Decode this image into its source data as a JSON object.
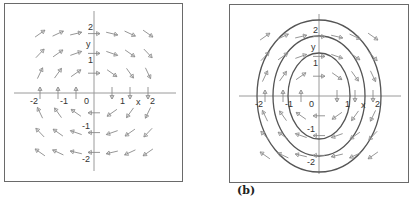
{
  "figure": {
    "caption_b": "(b)",
    "panels": [
      {
        "id": "a",
        "description": "Direction field of a rotational (clockwise) vector field",
        "x_tick_labels": [
          "-2",
          "-1",
          "0",
          "1",
          "2"
        ],
        "y_tick_labels": [
          "2",
          "1",
          "-1",
          "-2"
        ],
        "x_axis_label": "x",
        "y_axis_label": "y",
        "has_solution_curves": false
      },
      {
        "id": "b",
        "description": "Same direction field with three elliptical solution curves",
        "x_tick_labels": [
          "-2",
          "-1",
          "0",
          "1",
          "2"
        ],
        "y_tick_labels": [
          "2",
          "1",
          "-1",
          "-2"
        ],
        "x_axis_label": "x",
        "y_axis_label": "y",
        "has_solution_curves": true,
        "solution_curves": 3
      }
    ],
    "colors": {
      "arrow": "#8a8a8a",
      "axis": "#9a9a9a",
      "curve": "#555555",
      "frame": "#6a6a6a"
    }
  }
}
